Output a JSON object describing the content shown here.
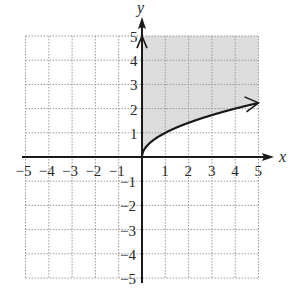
{
  "chart_data": {
    "type": "line",
    "title": "",
    "xlabel": "x",
    "ylabel": "y",
    "xlim": [
      -5,
      5
    ],
    "ylim": [
      -5,
      5
    ],
    "grid": true,
    "x_ticks": [
      "-5",
      "-4",
      "-3",
      "-2",
      "-1",
      "1",
      "2",
      "3",
      "4",
      "5"
    ],
    "y_ticks": [
      "5",
      "4",
      "3",
      "2",
      "1",
      "-1",
      "-2",
      "-3",
      "-4",
      "-5"
    ],
    "series": [
      {
        "name": "y = sqrt(x)",
        "x": [
          0,
          0.25,
          0.5,
          1,
          1.5,
          2,
          2.5,
          3,
          3.5,
          4,
          4.5,
          5
        ],
        "values": [
          0,
          0.5,
          0.71,
          1,
          1.22,
          1.41,
          1.58,
          1.73,
          1.87,
          2,
          2.12,
          2.24
        ],
        "style": "solid",
        "arrow_end": true
      }
    ],
    "shaded_region": {
      "description": "region above y = sqrt(x), x >= 0, up to y = 5",
      "inequality": "y >= sqrt(x)",
      "color": "#d9d9d9"
    },
    "colors": {
      "axis": "#1a1a1a",
      "grid": "#9a9a9a",
      "curve": "#1a1a1a",
      "shade": "#dcdcdc"
    }
  }
}
